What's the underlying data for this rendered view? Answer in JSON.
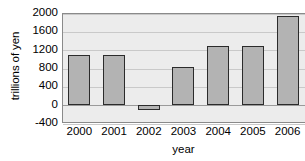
{
  "chart_data": {
    "type": "bar",
    "title": "",
    "title_clipped": true,
    "xlabel": "year",
    "ylabel": "trillions of yen",
    "categories": [
      "2000",
      "2001",
      "2002",
      "2003",
      "2004",
      "2005",
      "2006"
    ],
    "values": [
      1080,
      1080,
      -120,
      830,
      1290,
      1270,
      1930
    ],
    "series": [
      {
        "name": "trillions of yen",
        "values": [
          1080,
          1080,
          -120,
          830,
          1290,
          1270,
          1930
        ]
      }
    ],
    "ylim": [
      -400,
      2000
    ],
    "yticks": [
      2000,
      1600,
      1200,
      800,
      400,
      0,
      -400
    ],
    "ytick_labels": [
      "2000",
      "1600",
      "1200",
      "800",
      "400",
      "0",
      "-400"
    ],
    "xtick_labels": [
      "2000",
      "2001",
      "2002",
      "2003",
      "2004",
      "2005",
      "2006"
    ],
    "grid": true,
    "grid_axis": "y",
    "legend": false,
    "legend_position": "none",
    "colors": {
      "bar_fill": "#b3b3b3",
      "bar_border": "#2b2b2b",
      "plot_background": "#ececec",
      "gridline": "#c9c9c9",
      "zero_line": "#9a9a9a",
      "axis_border": "#8a8a8a",
      "text": "#000000"
    }
  }
}
